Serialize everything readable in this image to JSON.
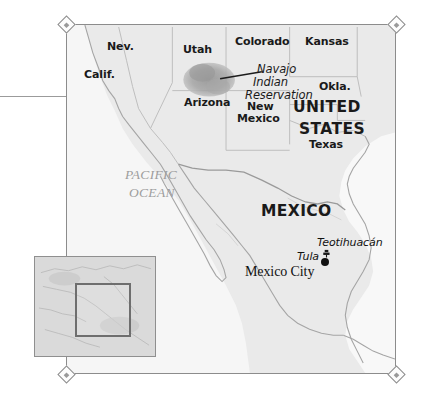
{
  "map": {
    "title_region": "Mexico and southwestern United States",
    "background_color": "#eeeeee",
    "frame_color": "#8c8c8c",
    "land_color": "#e9e9e9",
    "water_color": "#f7f7f7",
    "border_color": "#b4b4b4",
    "coast_color": "#a0a0a0",
    "highlight_color": "#9a9a9a",
    "states": [
      {
        "key": "nevada",
        "label": "Nev."
      },
      {
        "key": "california",
        "label": "Calif."
      },
      {
        "key": "utah",
        "label": "Utah"
      },
      {
        "key": "colorado",
        "label": "Colorado"
      },
      {
        "key": "kansas",
        "label": "Kansas"
      },
      {
        "key": "oklahoma",
        "label": "Okla."
      },
      {
        "key": "arizona",
        "label": "Arizona"
      },
      {
        "key": "new-mexico",
        "label": "New\nMexico"
      },
      {
        "key": "texas",
        "label": "Texas"
      }
    ],
    "state_labels": {
      "nevada": "Nev.",
      "california": "Calif.",
      "utah": "Utah",
      "colorado": "Colorado",
      "kansas": "Kansas",
      "oklahoma": "Okla.",
      "arizona": "Arizona",
      "new_mexico_line1": "New",
      "new_mexico_line2": "Mexico",
      "texas": "Texas"
    },
    "countries": {
      "united_states_line1": "UNITED",
      "united_states_line2": "STATES",
      "mexico": "MEXICO"
    },
    "ocean": {
      "line1": "PACIFIC",
      "line2": "OCEAN"
    },
    "reservation": {
      "line1": "Navajo",
      "line2": "Indian",
      "line3": "Reservation"
    },
    "places": [
      {
        "key": "mexico-city",
        "label": "Mexico City",
        "symbol": "city-dot"
      },
      {
        "key": "tula",
        "label": "Tula",
        "symbol": "site-label"
      },
      {
        "key": "teotihuacan",
        "label": "Teotihuacán",
        "symbol": "pyramid-icon"
      }
    ],
    "place_labels": {
      "mexico_city": "Mexico City",
      "tula": "Tula",
      "teotihuacan": "Teotihuacán"
    },
    "inset": {
      "description": "Locator inset of the Americas with highlight box"
    }
  }
}
